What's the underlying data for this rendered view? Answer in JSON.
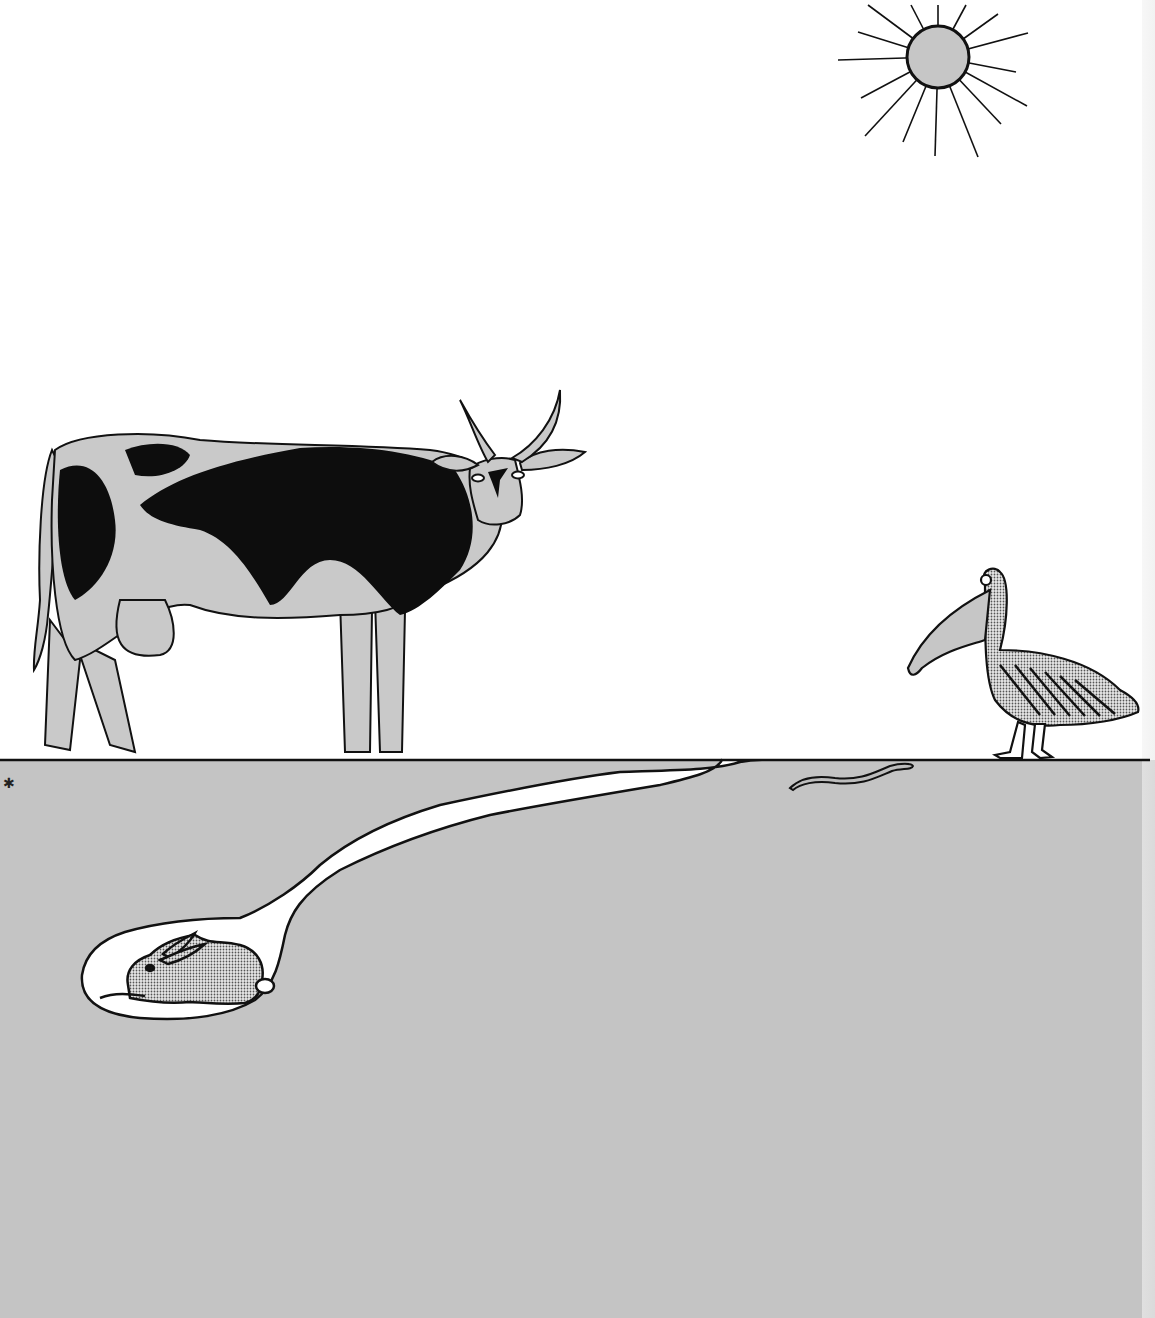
{
  "scene": {
    "title": "",
    "colors": {
      "sky": "#ffffff",
      "ground": "#c4c4c4",
      "outline": "#111111",
      "fill_gray": "#c9c9c9",
      "spot_black": "#0d0d0d",
      "burrow": "#ffffff"
    },
    "elements": [
      {
        "id": "sun",
        "label": "sun",
        "x": 938,
        "y": 57,
        "radius": 32,
        "rays": 18
      },
      {
        "id": "cow",
        "label": "cow",
        "x": 35,
        "y": 390,
        "width": 560,
        "height": 370
      },
      {
        "id": "pelican",
        "label": "pelican",
        "x": 905,
        "y": 565,
        "width": 235,
        "height": 195
      },
      {
        "id": "ground-line",
        "label": "ground surface",
        "y": 760
      },
      {
        "id": "earthworm",
        "label": "earthworm",
        "x": 790,
        "y": 765,
        "width": 125,
        "height": 25
      },
      {
        "id": "burrow",
        "label": "rabbit burrow tunnel",
        "entry_x": 740,
        "entry_y": 760
      },
      {
        "id": "rabbit",
        "label": "rabbit",
        "x": 125,
        "y": 930,
        "width": 150,
        "height": 80
      }
    ]
  }
}
